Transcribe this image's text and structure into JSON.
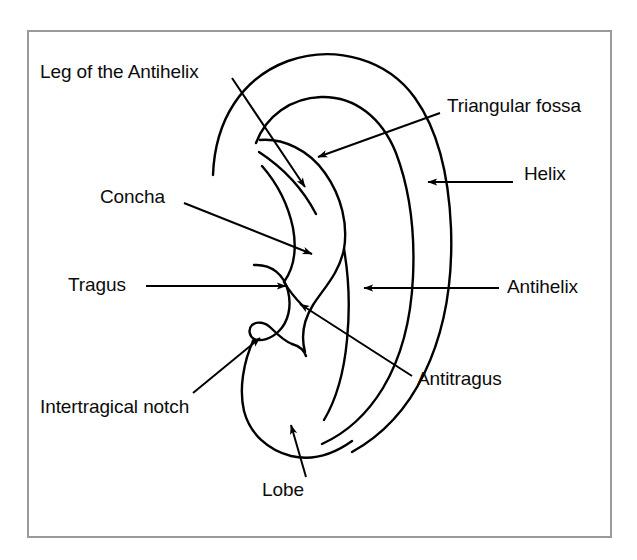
{
  "figure": {
    "type": "anatomical-diagram",
    "border_color": "#9a9a9a",
    "line_color": "#000000",
    "background_color": "#ffffff",
    "label_color": "#0c0c0c"
  },
  "labels": {
    "leg_of_the_antihelix": "Leg of the Antihelix",
    "triangular_fossa": "Triangular fossa",
    "helix": "Helix",
    "concha": "Concha",
    "tragus": "Tragus",
    "antihelix": "Antihelix",
    "antitragus": "Antitragus",
    "intertragical_notch": "Intertragical notch",
    "lobe": "Lobe"
  },
  "callouts": [
    {
      "id": "leg-of-the-antihelix",
      "label": "Leg of the Antihelix",
      "label_x": 40,
      "label_y": 62,
      "leader_from": [
        232,
        78
      ],
      "leader_to": [
        305,
        187
      ],
      "arrow_direction": "down-right"
    },
    {
      "id": "triangular-fossa",
      "label": "Triangular fossa",
      "label_x": 447,
      "label_y": 96,
      "leader_from": [
        440,
        113
      ],
      "leader_to": [
        318,
        157
      ],
      "arrow_direction": "down-left"
    },
    {
      "id": "helix",
      "label": "Helix",
      "label_x": 524,
      "label_y": 164,
      "leader_from": [
        513,
        182
      ],
      "leader_to": [
        428,
        182
      ],
      "arrow_direction": "left"
    },
    {
      "id": "concha",
      "label": "Concha",
      "label_x": 100,
      "label_y": 187,
      "leader_from": [
        184,
        203
      ],
      "leader_to": [
        312,
        254
      ],
      "arrow_direction": "down-right"
    },
    {
      "id": "tragus",
      "label": "Tragus",
      "label_x": 68,
      "label_y": 275,
      "leader_from": [
        146,
        286
      ],
      "leader_to": [
        286,
        286
      ],
      "arrow_direction": "right"
    },
    {
      "id": "antihelix",
      "label": "Antihelix",
      "label_x": 507,
      "label_y": 277,
      "leader_from": [
        499,
        288
      ],
      "leader_to": [
        364,
        288
      ],
      "arrow_direction": "left"
    },
    {
      "id": "antitragus",
      "label": "Antitragus",
      "label_x": 417,
      "label_y": 369,
      "leader_from": [
        412,
        376
      ],
      "leader_to": [
        300,
        304
      ],
      "arrow_direction": "up-left"
    },
    {
      "id": "intertragical-notch",
      "label": "Intertragical notch",
      "label_x": 40,
      "label_y": 397,
      "leader_from": [
        193,
        393
      ],
      "leader_to": [
        260,
        338
      ],
      "arrow_direction": "up-right"
    },
    {
      "id": "lobe",
      "label": "Lobe",
      "label_x": 262,
      "label_y": 480,
      "leader_from": [
        306,
        477
      ],
      "leader_to": [
        291,
        425
      ],
      "arrow_direction": "up-left"
    }
  ]
}
